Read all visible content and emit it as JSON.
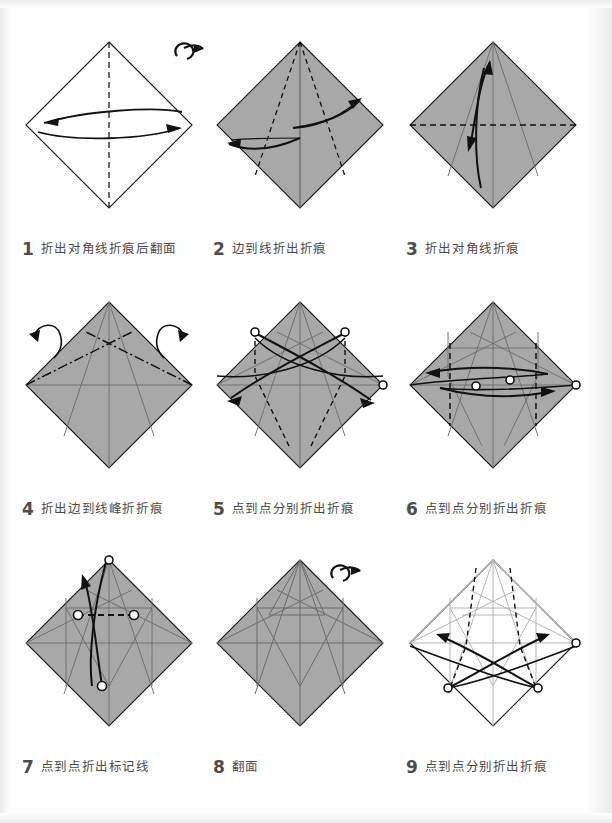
{
  "document": {
    "type": "origami-instruction-diagram",
    "language": "zh-CN",
    "page_background": "#ffffff",
    "paper_front_color": "#a8a8a8",
    "paper_back_color": "#ffffff",
    "line_color": "#1a1a1a",
    "crease_color": "#6b6b6b",
    "arrow_color": "#111111",
    "caption_color": "#4a4a4a"
  },
  "steps": [
    {
      "number": "1",
      "text": "折出对角线折痕后翻面",
      "side": "white",
      "has_turnover_icon": true,
      "icon_name": "turn-over-icon",
      "creases": [
        "vertical-valley-dashed"
      ],
      "arrows": [
        "horizontal-double-fold-arrow"
      ]
    },
    {
      "number": "2",
      "text": "边到线折出折痕",
      "side": "gray",
      "has_turnover_icon": false,
      "creases": [
        "vertical-center",
        "two-dashed-diagonals-from-top"
      ],
      "arrows": [
        "curved-arrow-left",
        "curved-arrow-right"
      ]
    },
    {
      "number": "3",
      "text": "折出对角线折痕",
      "side": "gray",
      "has_turnover_icon": false,
      "creases": [
        "horizontal-valley-dashed",
        "existing-thin-diagonals"
      ],
      "arrows": [
        "vertical-double-fold-arrow"
      ]
    },
    {
      "number": "4",
      "text": "折出边到线峰折折痕",
      "side": "gray",
      "has_turnover_icon": false,
      "creases": [
        "two-crossing-mountain-dashdot"
      ],
      "arrows": [
        "mountain-curl-arrow-left",
        "mountain-curl-arrow-right"
      ]
    },
    {
      "number": "5",
      "text": "点到点分别折出折痕",
      "side": "gray",
      "has_turnover_icon": false,
      "creases": [
        "two-dashed-v-creases"
      ],
      "reference_points": [
        "upper-left",
        "upper-right",
        "right-corner"
      ],
      "arrows": [
        "crossing-arrow-left",
        "crossing-arrow-right"
      ]
    },
    {
      "number": "6",
      "text": "点到点分别折出折痕",
      "side": "gray",
      "has_turnover_icon": false,
      "creases": [
        "two-vertical-dashed"
      ],
      "reference_points": [
        "center-left",
        "center-right",
        "left-corner",
        "right-corner"
      ],
      "arrows": [
        "horizontal-arrow-left",
        "horizontal-arrow-right"
      ]
    },
    {
      "number": "7",
      "text": "点到点折出标记线",
      "side": "gray",
      "has_turnover_icon": false,
      "creases": [
        "short-horizontal-dashed-mark"
      ],
      "reference_points": [
        "top-vertex",
        "inner-left",
        "inner-right",
        "center-bottom"
      ],
      "arrows": [
        "narrow-double-arrow-vertical"
      ]
    },
    {
      "number": "8",
      "text": "翻面",
      "side": "gray",
      "has_turnover_icon": true,
      "icon_name": "turn-over-icon",
      "creases": [
        "full-crease-pattern"
      ],
      "arrows": []
    },
    {
      "number": "9",
      "text": "点到点分别折出折痕",
      "side": "white",
      "has_turnover_icon": false,
      "creases": [
        "full-crease-pattern-light",
        "two-dashed-v-creases"
      ],
      "reference_points": [
        "lower-left",
        "lower-right",
        "right-corner"
      ],
      "arrows": [
        "crossing-arrow-left",
        "crossing-arrow-right"
      ]
    }
  ]
}
